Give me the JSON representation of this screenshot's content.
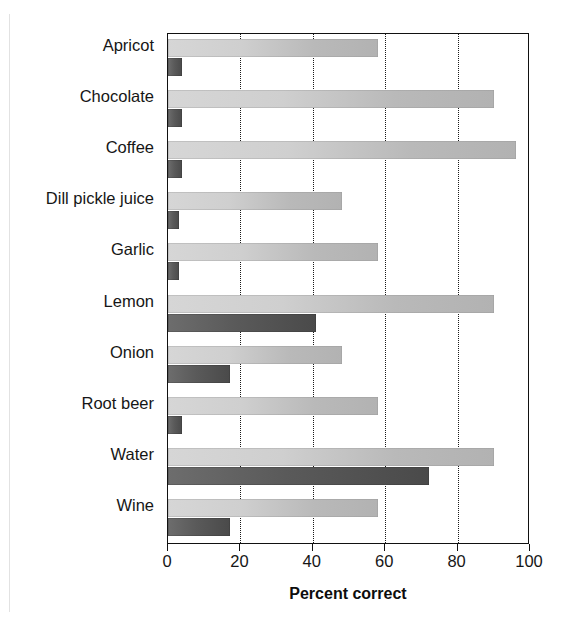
{
  "figure": {
    "cropped_title": "",
    "background_color": "#ffffff"
  },
  "chart_data": {
    "type": "bar",
    "orientation": "horizontal",
    "title": "",
    "xlabel": "Percent correct",
    "ylabel": "",
    "xlim": [
      0,
      100
    ],
    "ylim": null,
    "grid": true,
    "grid_axis": "x",
    "legend": null,
    "categories": [
      "Apricot",
      "Chocolate",
      "Coffee",
      "Dill pickle juice",
      "Garlic",
      "Lemon",
      "Onion",
      "Root beer",
      "Water",
      "Wine"
    ],
    "xticks": [
      0,
      20,
      40,
      60,
      80,
      100
    ],
    "xtick_labels": [
      "0",
      "20",
      "40",
      "60",
      "80",
      "100"
    ],
    "series": [
      {
        "name": "light-bar",
        "color": "#c8c8c8",
        "values": [
          58,
          90,
          96,
          48,
          58,
          90,
          48,
          58,
          90,
          58
        ]
      },
      {
        "name": "dark-bar",
        "color": "#555555",
        "values": [
          4,
          4,
          4,
          3,
          3,
          41,
          17,
          4,
          72,
          17
        ]
      }
    ]
  }
}
